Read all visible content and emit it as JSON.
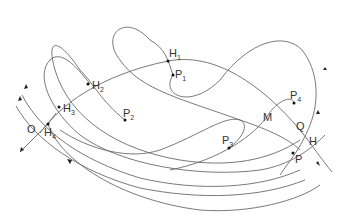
{
  "diagram": {
    "colors": {
      "curve": "#6a6a6a",
      "point": "#111111",
      "label": "#333333"
    },
    "labels": {
      "H1": {
        "main": "H",
        "sub": "1"
      },
      "H2": {
        "main": "H",
        "sub": "2"
      },
      "H3": {
        "main": "H",
        "sub": "3"
      },
      "H4": {
        "main": "H",
        "sub": "4"
      },
      "P1": {
        "main": "P",
        "sub": "1"
      },
      "P2": {
        "main": "P",
        "sub": "2"
      },
      "P3": {
        "main": "P",
        "sub": "3"
      },
      "P4": {
        "main": "P",
        "sub": "4"
      },
      "O": "O",
      "M": "M",
      "Q": "Q",
      "H": "H",
      "P": "P"
    },
    "points": [
      {
        "id": "H1",
        "x": 168,
        "y": 61
      },
      {
        "id": "P1",
        "x": 173,
        "y": 75
      },
      {
        "id": "H2",
        "x": 88,
        "y": 83
      },
      {
        "id": "H3",
        "x": 59,
        "y": 108
      },
      {
        "id": "H4",
        "x": 48,
        "y": 124
      },
      {
        "id": "P2",
        "x": 125,
        "y": 120
      },
      {
        "id": "P3",
        "x": 229,
        "y": 148
      },
      {
        "id": "P4",
        "x": 294,
        "y": 103
      },
      {
        "id": "P",
        "x": 293,
        "y": 153
      }
    ]
  }
}
